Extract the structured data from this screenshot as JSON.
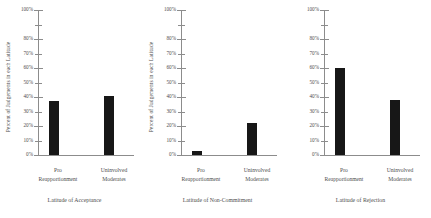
{
  "figure": {
    "background": "#ffffff",
    "ink": "#4d4d4d",
    "bar_color": "#171717",
    "axis_color": "#8c8c8c"
  },
  "axis": {
    "ylabel": "Percent of Judgements in each Latitude",
    "ytick_labels": [
      "100%",
      "",
      "80%",
      "70%",
      "60%",
      "50%",
      "40%",
      "30%",
      "20%",
      "10%",
      "0%"
    ],
    "ytick_values": [
      100,
      90,
      80,
      70,
      60,
      50,
      40,
      30,
      20,
      10,
      0
    ],
    "ylim": [
      0,
      100
    ],
    "categories": [
      {
        "line1": "Pro",
        "line2": "Reapportionment"
      },
      {
        "line1": "Uninvolved",
        "line2": "Moderates"
      }
    ]
  },
  "panels": [
    {
      "caption": "Latitude of Acceptance"
    },
    {
      "caption": "Latitude of Non-Commitment"
    },
    {
      "caption": "Latitude of Rejection"
    }
  ],
  "chart_data": [
    {
      "type": "bar",
      "title": "Latitude of Acceptance",
      "categories": [
        "Pro Reapportionment",
        "Uninvolved Moderates"
      ],
      "values": [
        37,
        41
      ],
      "xlabel": "",
      "ylabel": "Percent of Judgements in each Latitude",
      "ylim": [
        0,
        100
      ],
      "ytick_labels": [
        "0%",
        "10%",
        "20%",
        "30%",
        "40%",
        "50%",
        "60%",
        "70%",
        "80%",
        "",
        "100%"
      ],
      "grid": false,
      "legend": "none"
    },
    {
      "type": "bar",
      "title": "Latitude of Non-Commitment",
      "categories": [
        "Pro Reapportionment",
        "Uninvolved Moderates"
      ],
      "values": [
        3,
        22
      ],
      "xlabel": "",
      "ylabel": "Percent of Judgements in each Latitude",
      "ylim": [
        0,
        100
      ],
      "ytick_labels": [
        "0%",
        "10%",
        "20%",
        "30%",
        "40%",
        "50%",
        "60%",
        "70%",
        "80%",
        "",
        "100%"
      ],
      "grid": false,
      "legend": "none"
    },
    {
      "type": "bar",
      "title": "Latitude of Rejection",
      "categories": [
        "Pro Reapportionment",
        "Uninvolved Moderates"
      ],
      "values": [
        60,
        38
      ],
      "xlabel": "",
      "ylabel": "Percent of Judgements in each Latitude",
      "ylim": [
        0,
        100
      ],
      "ytick_labels": [
        "0%",
        "10%",
        "20%",
        "30%",
        "40%",
        "50%",
        "60%",
        "70%",
        "80%",
        "",
        "100%"
      ],
      "grid": false,
      "legend": "none"
    }
  ]
}
